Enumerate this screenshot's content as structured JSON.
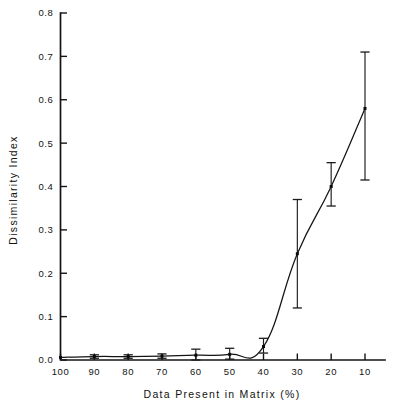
{
  "figure": {
    "kind": "scientific-line-plot",
    "background_color": "#ffffff",
    "ink_color": "#141414"
  },
  "chart_data": {
    "type": "line",
    "title": "",
    "xlabel": "Data Present in Matrix (%)",
    "ylabel": "Dissimilarity Index",
    "xlim": [
      100,
      5
    ],
    "ylim": [
      0.0,
      0.8
    ],
    "x_reversed": true,
    "grid": false,
    "legend": null,
    "xticks": [
      100,
      90,
      80,
      70,
      60,
      50,
      40,
      30,
      20,
      10
    ],
    "xticklabels": [
      "100",
      "90",
      "80",
      "70",
      "60",
      "50",
      "40",
      "30",
      "20",
      "10"
    ],
    "yticks": [
      0.0,
      0.1,
      0.2,
      0.3,
      0.4,
      0.5,
      0.6,
      0.7,
      0.8
    ],
    "yticklabels": [
      "0.0",
      "0.1",
      "0.2",
      "0.3",
      "0.4",
      "0.5",
      "0.6",
      "0.7",
      "0.8"
    ],
    "x": [
      100,
      90,
      80,
      70,
      60,
      50,
      40,
      30,
      20,
      10
    ],
    "values": [
      0.006,
      0.008,
      0.008,
      0.009,
      0.011,
      0.013,
      0.031,
      0.245,
      0.4,
      0.58
    ],
    "error_low": [
      0.006,
      0.004,
      0.004,
      0.004,
      0.0,
      0.002,
      0.016,
      0.12,
      0.355,
      0.415
    ],
    "error_high": [
      0.006,
      0.012,
      0.012,
      0.014,
      0.025,
      0.027,
      0.05,
      0.37,
      0.455,
      0.71
    ],
    "marker": "square",
    "marker_size": 3,
    "line_style": "solid"
  }
}
